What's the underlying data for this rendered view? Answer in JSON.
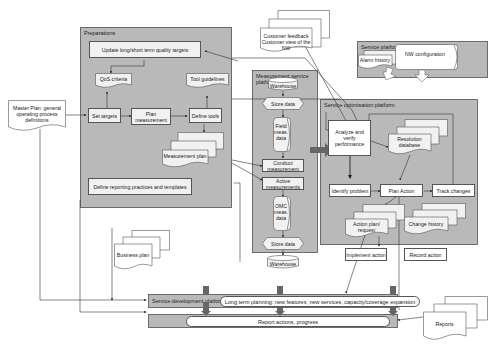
{
  "external_inputs": {
    "master_plan": "Master Plan: general operating process definitions",
    "customer_feedback": "Customer feedback Customer view of the NW",
    "business_plan": "Business plan",
    "reports": "Reports"
  },
  "preparations": {
    "title": "Preparations",
    "update_targets": "Update long/short term quality targets",
    "qos_criteria": "QoS criteria",
    "tool_guidelines": "Tool guidelines",
    "set_targets": "Set targets",
    "plan_measurement": "Plan measurement",
    "define_tools": "Define tools",
    "measurement_plan": "Measurement plan",
    "define_reporting": "Define reporting practices and templates"
  },
  "measurement_platform": {
    "title": "Measurement service platform",
    "warehouse_top": "Warehouse",
    "store_data_top": "Store data",
    "field_meas_data": "Field meas. data",
    "conduct_measurement": "Conduct measurement",
    "active_measurements": "Active measurements",
    "omc_meas_data": "OMC meas. data",
    "store_data_bottom": "Store data",
    "warehouse_bottom": "Warehouse"
  },
  "service_platform": {
    "title": "Service platform",
    "alarm_history": "Alarm history",
    "nw_configuration": "NW configuration"
  },
  "optimisation_platform": {
    "title": "Service optimisation platform",
    "analyze": "Analyze and verify performance",
    "resolution_database": "Resolution database",
    "identify_problem": "Identify problem",
    "plan_action": "Plan Action",
    "track_changes": "Track changes",
    "action_plan_request": "Action plan/ request",
    "change_history": "Change history",
    "implement_action": "Implement action",
    "record_action": "Record action"
  },
  "development_platform": {
    "title": "Service development platform",
    "long_term": "Long term planning: new features, new services, capacity/coverage expansion",
    "report_actions": "Report actions, progress"
  },
  "colors": {
    "platform_fill": "#b9b9b9",
    "box_fill": "#f1f1f1",
    "line": "#444444",
    "big_arrow": "#666666"
  }
}
